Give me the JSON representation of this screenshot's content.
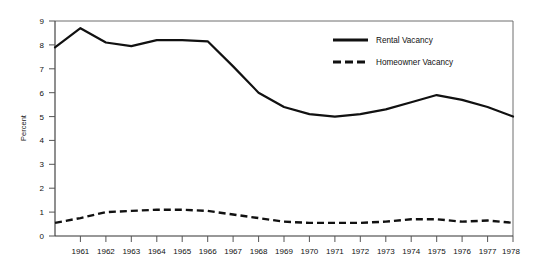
{
  "chart_data": {
    "type": "line",
    "title": "",
    "xlabel": "",
    "ylabel": "Percent",
    "ylim": [
      0,
      9
    ],
    "xlim": [
      1960,
      1978
    ],
    "grid": false,
    "legend_position": "top-right",
    "y_ticks": [
      "0",
      "1",
      "2",
      "3",
      "4",
      "5",
      "6",
      "7",
      "8",
      "9"
    ],
    "x_tick_labels": [
      "1961",
      "1962",
      "1963",
      "1964",
      "1965",
      "1966",
      "1967",
      "1968",
      "1969",
      "1970",
      "1971",
      "1972",
      "1973",
      "1974",
      "1975",
      "1976",
      "1977",
      "1978"
    ],
    "x": [
      1960,
      1961,
      1962,
      1963,
      1964,
      1965,
      1966,
      1967,
      1968,
      1969,
      1970,
      1971,
      1972,
      1973,
      1974,
      1975,
      1976,
      1977,
      1978
    ],
    "series": [
      {
        "name": "Rental Vacancy",
        "style": "solid",
        "color": "#111111",
        "values": [
          7.9,
          8.7,
          8.1,
          7.95,
          8.2,
          8.2,
          8.15,
          7.1,
          6.0,
          5.4,
          5.1,
          5.0,
          5.1,
          5.3,
          5.6,
          5.9,
          5.7,
          5.4,
          5.0
        ]
      },
      {
        "name": "Homeowner Vacancy",
        "style": "dashed",
        "color": "#111111",
        "values": [
          0.55,
          0.75,
          1.0,
          1.05,
          1.1,
          1.1,
          1.05,
          0.9,
          0.75,
          0.6,
          0.55,
          0.55,
          0.55,
          0.6,
          0.7,
          0.7,
          0.6,
          0.65,
          0.55
        ]
      }
    ]
  },
  "legend": {
    "entries": [
      {
        "label": "Rental Vacancy",
        "style": "solid"
      },
      {
        "label": "Homeowner Vacancy",
        "style": "dashed"
      }
    ]
  }
}
